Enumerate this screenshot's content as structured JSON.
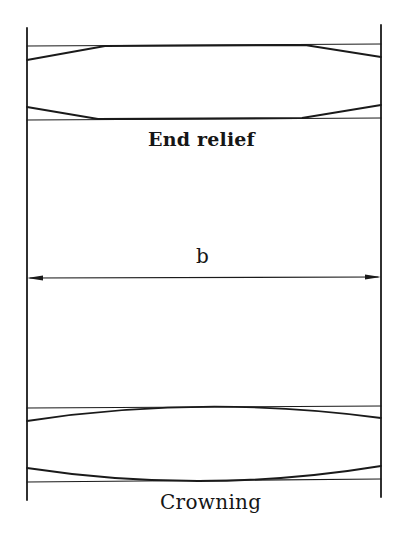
{
  "diagram": {
    "type": "engineering-schematic",
    "labels": {
      "end_relief": "End relief",
      "face_width": "b",
      "crowning": "Crowning"
    },
    "panels": [
      {
        "name": "end-relief",
        "description": "Tooth profile with straight chamfered ends (linear relief) between two reference lines",
        "top_reference_y": 45,
        "bottom_reference_y": 119,
        "left_relief_end_x": 105,
        "right_relief_start_x": 305
      },
      {
        "name": "face-width-dimension",
        "description": "Double-headed arrow spanning full face width",
        "arrow_y": 278
      },
      {
        "name": "crowning",
        "description": "Tooth profile with curved (barrelled) flank between two reference lines",
        "top_reference_y": 407,
        "bottom_reference_y": 480
      }
    ],
    "colors": {
      "line": "#1a1a1a",
      "background": "#ffffff"
    }
  }
}
